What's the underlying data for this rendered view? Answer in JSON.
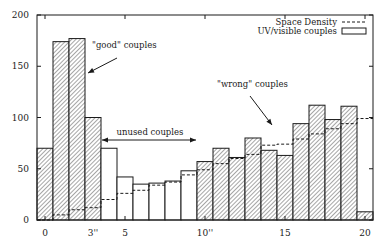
{
  "chart_data": {
    "type": "bar",
    "title": "",
    "xlabel": "",
    "ylabel": "",
    "xlim": [
      -0.5,
      20.5
    ],
    "ylim": [
      0,
      200
    ],
    "grid": false,
    "legend_position": "top-right",
    "x": [
      0,
      1,
      2,
      3,
      4,
      5,
      6,
      7,
      8,
      9,
      10,
      11,
      12,
      13,
      14,
      15,
      16,
      17,
      18,
      19,
      20
    ],
    "x_tick_labels": [
      {
        "value": 0,
        "label": "0"
      },
      {
        "value": 3,
        "label": "3''"
      },
      {
        "value": 5,
        "label": "5"
      },
      {
        "value": 10,
        "label": "10''"
      },
      {
        "value": 15,
        "label": "15"
      },
      {
        "value": 20,
        "label": "20"
      }
    ],
    "y_tick_labels": [
      {
        "value": 0,
        "label": "0"
      },
      {
        "value": 50,
        "label": "50"
      },
      {
        "value": 100,
        "label": "100"
      },
      {
        "value": 150,
        "label": "150"
      },
      {
        "value": 200,
        "label": "200"
      }
    ],
    "series": [
      {
        "name": "UV/visible couples",
        "style": "bar",
        "values": [
          70,
          174,
          177,
          100,
          70,
          42,
          35,
          36,
          38,
          48,
          57,
          70,
          61,
          80,
          68,
          63,
          94,
          112,
          98,
          111,
          8
        ],
        "hatched": [
          true,
          true,
          true,
          true,
          false,
          false,
          false,
          false,
          false,
          false,
          true,
          true,
          true,
          true,
          true,
          true,
          true,
          true,
          true,
          true,
          true
        ]
      },
      {
        "name": "Space Density",
        "style": "dashed-step",
        "values": [
          0,
          5,
          10,
          12,
          20,
          26,
          29,
          34,
          37,
          44,
          49,
          55,
          60,
          64,
          73,
          74,
          79,
          84,
          89,
          94,
          99
        ]
      }
    ],
    "annotations": [
      {
        "text": "\"good\" couples",
        "x": 92,
        "y": 48,
        "arrow": {
          "x1": 117,
          "y1": 58,
          "x2": 88,
          "y2": 73
        }
      },
      {
        "text": "unused couples",
        "x": 150,
        "y": 135,
        "anchor": "middle",
        "arrow": {
          "x1": 102,
          "y1": 140,
          "x2": 196,
          "y2": 140,
          "double": true
        }
      },
      {
        "text": "\"wrong\" couples",
        "x": 217,
        "y": 87,
        "arrow": {
          "x1": 250,
          "y1": 96,
          "x2": 272,
          "y2": 125
        }
      }
    ],
    "legend": [
      {
        "label": "Space Density",
        "symbol": "dashed-line"
      },
      {
        "label": "UV/visible couples",
        "symbol": "open-box"
      }
    ]
  },
  "colors": {
    "ink": "#1a1a1a",
    "background": "#ffffff",
    "hatch": "#3a3a3a"
  }
}
